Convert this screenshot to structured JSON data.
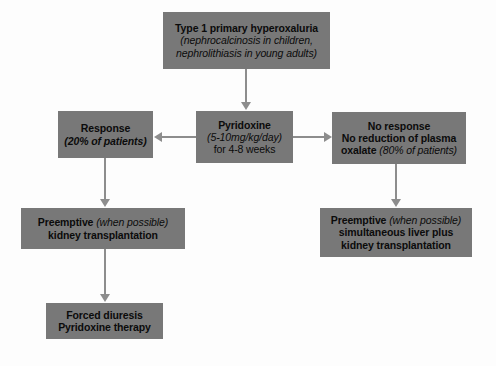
{
  "diagram": {
    "type": "flowchart",
    "colors": {
      "node_fill": "#787878",
      "node_text": "#0b0b0b",
      "edge": "#8d8d8d",
      "background": "#fdfdfd"
    },
    "nodes": [
      {
        "id": "diagnosis",
        "lines": [
          "Type 1 primary hyperoxaluria",
          "(nephrocalcinosis in children,",
          "nephrolithiasis in young adults)"
        ]
      },
      {
        "id": "pyridoxine",
        "lines": [
          "Pyridoxine",
          "(5-10mg/kg/day)",
          "for 4-8 weeks"
        ]
      },
      {
        "id": "response",
        "lines": [
          "Response",
          "(20% of patients)"
        ]
      },
      {
        "id": "noresponse",
        "lines": [
          "No response",
          "No reduction of plasma",
          "oxalate ",
          "(80% of patients)"
        ]
      },
      {
        "id": "kidney",
        "lines": [
          "Preemptive ",
          "(when possible)",
          "kidney transplantation"
        ]
      },
      {
        "id": "liver",
        "lines": [
          "Preemptive ",
          "(when possible)",
          "simultaneous liver plus",
          "kidney transplantation"
        ]
      },
      {
        "id": "forced",
        "lines": [
          "Forced diuresis",
          "Pyridoxine therapy"
        ]
      }
    ],
    "edges": [
      {
        "from": "diagnosis",
        "to": "pyridoxine",
        "direction": "down"
      },
      {
        "from": "pyridoxine",
        "to": "response",
        "direction": "left"
      },
      {
        "from": "pyridoxine",
        "to": "noresponse",
        "direction": "right"
      },
      {
        "from": "response",
        "to": "kidney",
        "direction": "down"
      },
      {
        "from": "noresponse",
        "to": "liver",
        "direction": "down"
      },
      {
        "from": "kidney",
        "to": "forced",
        "direction": "down"
      }
    ]
  }
}
